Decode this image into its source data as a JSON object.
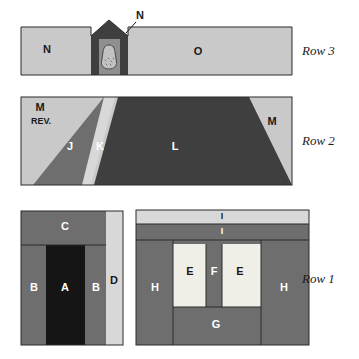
{
  "figure": {
    "background_color": "#ffffff"
  },
  "palette": {
    "light_gray": "#c9c9c9",
    "pale_gray": "#d8d8d8",
    "medium_gray": "#6e6e6e",
    "mid_gray": "#757575",
    "dark_gray": "#3f3f3f",
    "near_black": "#151515",
    "cream": "#efefe7",
    "outline": "#2b2b2b",
    "text_dark": "#1a1a1a",
    "text_light": "#ffffff"
  },
  "rows": [
    {
      "caption": "Row 3",
      "caption_x": 302,
      "caption_y": 52,
      "units": [
        {
          "id": "N-left",
          "label": "N",
          "x": 47,
          "y": 50,
          "tone": "dark"
        },
        {
          "id": "O",
          "label": "O",
          "x": 198,
          "y": 52,
          "tone": "dark"
        },
        {
          "id": "N-callout",
          "label": "N",
          "x": 117,
          "y": 16,
          "tone": "dark"
        }
      ]
    },
    {
      "caption": "Row 2",
      "caption_x": 302,
      "caption_y": 142,
      "units": [
        {
          "id": "M-upper-left",
          "label": "M",
          "x": 40,
          "y": 108,
          "tone": "dark"
        },
        {
          "id": "M-rev",
          "label": "REV.",
          "x": 40,
          "y": 122,
          "tone": "dark"
        },
        {
          "id": "J",
          "label": "J",
          "x": 70,
          "y": 147,
          "tone": "light"
        },
        {
          "id": "K",
          "label": "K",
          "x": 100,
          "y": 147,
          "tone": "light"
        },
        {
          "id": "L",
          "label": "L",
          "x": 175,
          "y": 147,
          "tone": "light"
        },
        {
          "id": "M-right",
          "label": "M",
          "x": 272,
          "y": 122,
          "tone": "dark"
        }
      ]
    },
    {
      "caption": "Row 1",
      "caption_x": 302,
      "caption_y": 280,
      "units": [
        {
          "id": "C",
          "label": "C",
          "x": 65,
          "y": 227,
          "tone": "light"
        },
        {
          "id": "B-left",
          "label": "B",
          "x": 34,
          "y": 288,
          "tone": "light"
        },
        {
          "id": "A",
          "label": "A",
          "x": 65,
          "y": 288,
          "tone": "light"
        },
        {
          "id": "B-right",
          "label": "B",
          "x": 96,
          "y": 288,
          "tone": "light"
        },
        {
          "id": "D",
          "label": "D",
          "x": 114,
          "y": 281,
          "tone": "light"
        },
        {
          "id": "I-top",
          "label": "I",
          "x": 222,
          "y": 216,
          "tone": "dark"
        },
        {
          "id": "I-second",
          "label": "I",
          "x": 222,
          "y": 232,
          "tone": "light"
        },
        {
          "id": "H-left",
          "label": "H",
          "x": 155,
          "y": 288,
          "tone": "light"
        },
        {
          "id": "E-left",
          "label": "E",
          "x": 192,
          "y": 272,
          "tone": "dark"
        },
        {
          "id": "F",
          "label": "F",
          "x": 215,
          "y": 272,
          "tone": "light"
        },
        {
          "id": "E-right",
          "label": "E",
          "x": 240,
          "y": 272,
          "tone": "dark"
        },
        {
          "id": "H-right",
          "label": "H",
          "x": 277,
          "y": 288,
          "tone": "light"
        },
        {
          "id": "G",
          "label": "G",
          "x": 216,
          "y": 323,
          "tone": "light"
        }
      ]
    }
  ]
}
